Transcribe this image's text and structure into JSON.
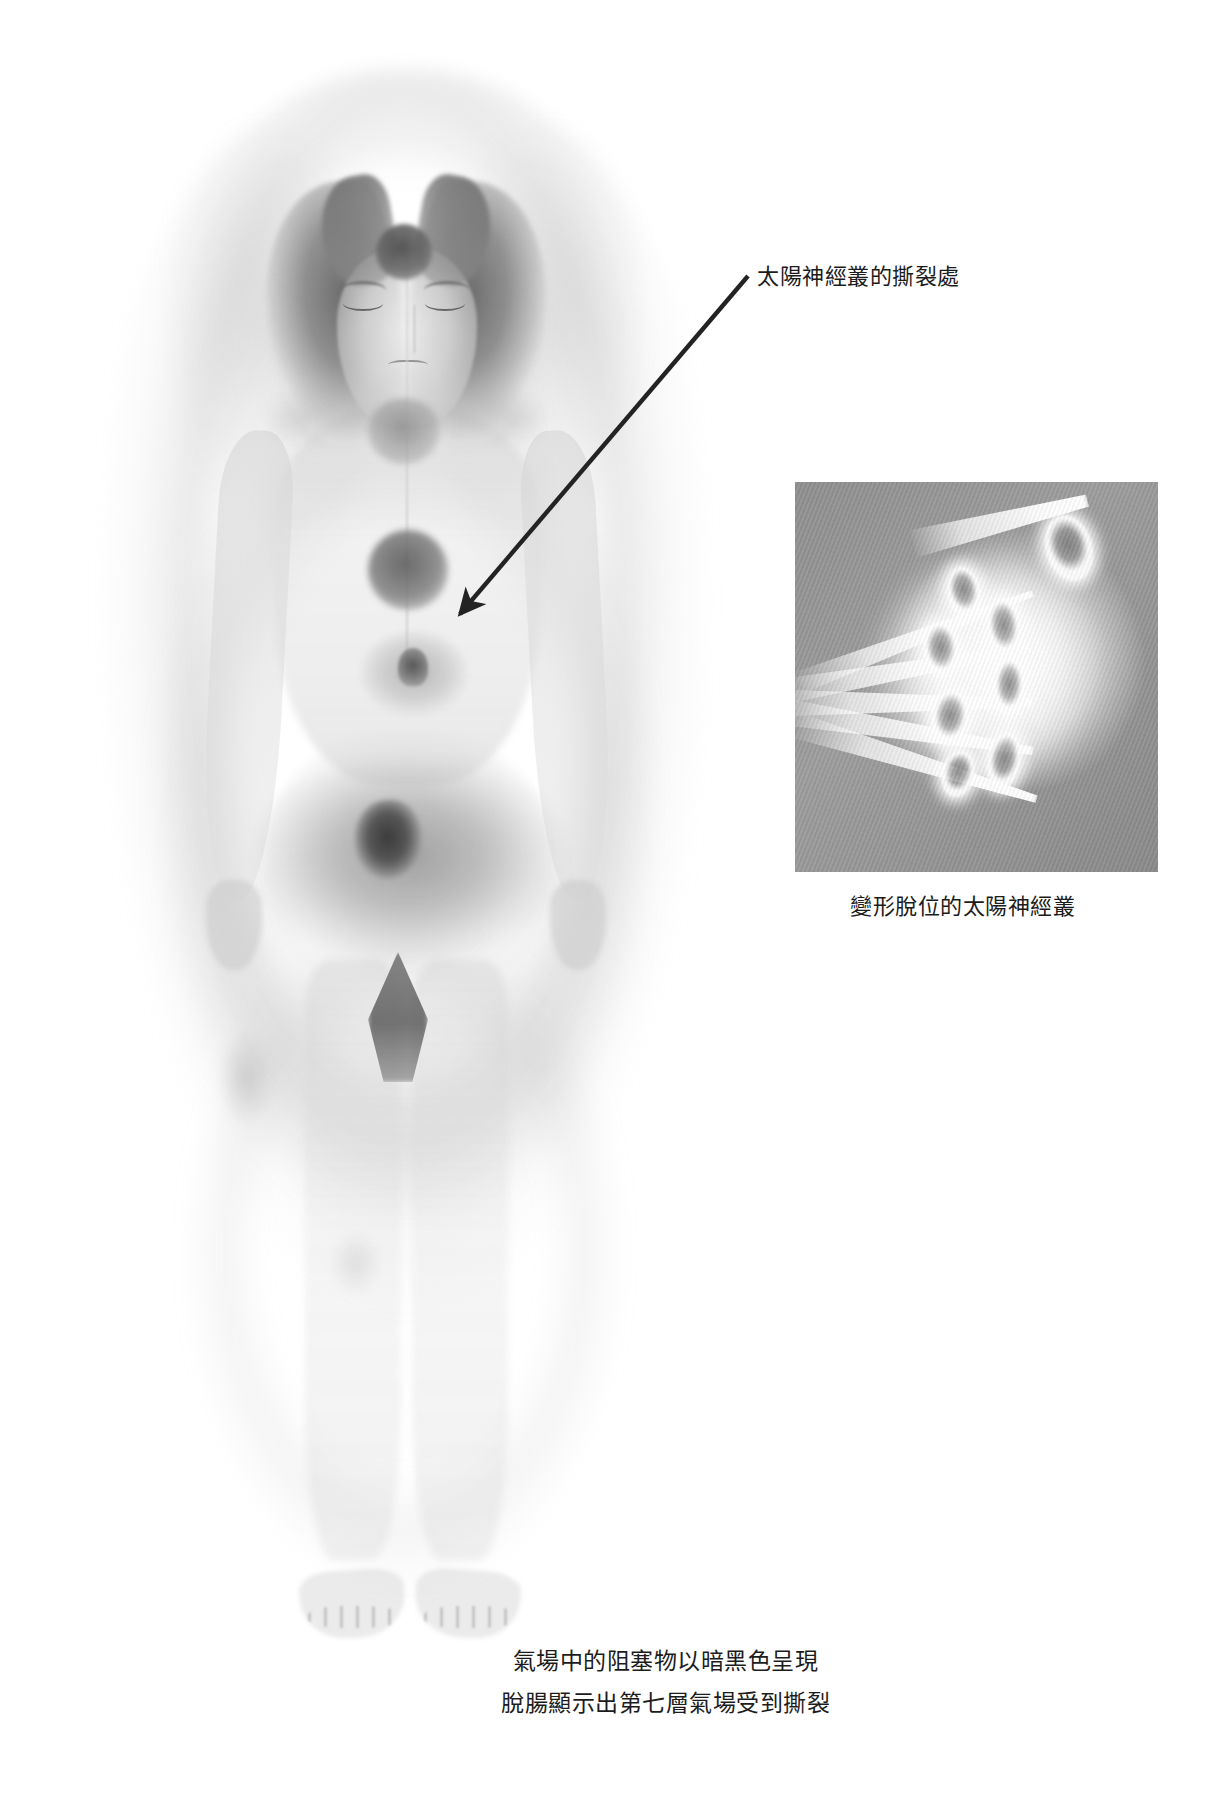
{
  "figure": {
    "title_alt": "human-energy-field-illustration",
    "chakras": [
      {
        "name": "crown-third-eye-chakra",
        "state": "dark"
      },
      {
        "name": "throat-chakra",
        "state": "gray"
      },
      {
        "name": "heart-chakra",
        "state": "dark"
      },
      {
        "name": "solar-plexus-chakra",
        "state": "torn-displaced"
      }
    ],
    "blockage": {
      "name": "pelvic-dark-blockage",
      "appearance": "dark-black-mass"
    },
    "hernia": {
      "name": "hernia-shape",
      "appearance": "dark-wedge"
    }
  },
  "annotations": {
    "tear_label": "太陽神經叢的撕裂處",
    "arrow": {
      "name": "pointer-arrow",
      "from_x": 748,
      "from_y": 276,
      "to_x": 452,
      "to_y": 622,
      "color": "#232323"
    }
  },
  "inset": {
    "name": "solar-plexus-detail-panel",
    "caption": "變形脫位的太陽神經叢",
    "background_color": "#919191",
    "cone_count": 5,
    "vortex_count": 7,
    "x": 795,
    "y": 482,
    "width": 363,
    "height": 390
  },
  "caption": {
    "lines": [
      "氣場中的阻塞物以暗黑色呈現",
      "脫腸顯示出第七層氣場受到撕裂"
    ]
  },
  "colors": {
    "page_background": "#ffffff",
    "ink": "#1c1c1c",
    "aura_gray": "#a8a8a8",
    "dark_mass": "#4a4a4a"
  }
}
